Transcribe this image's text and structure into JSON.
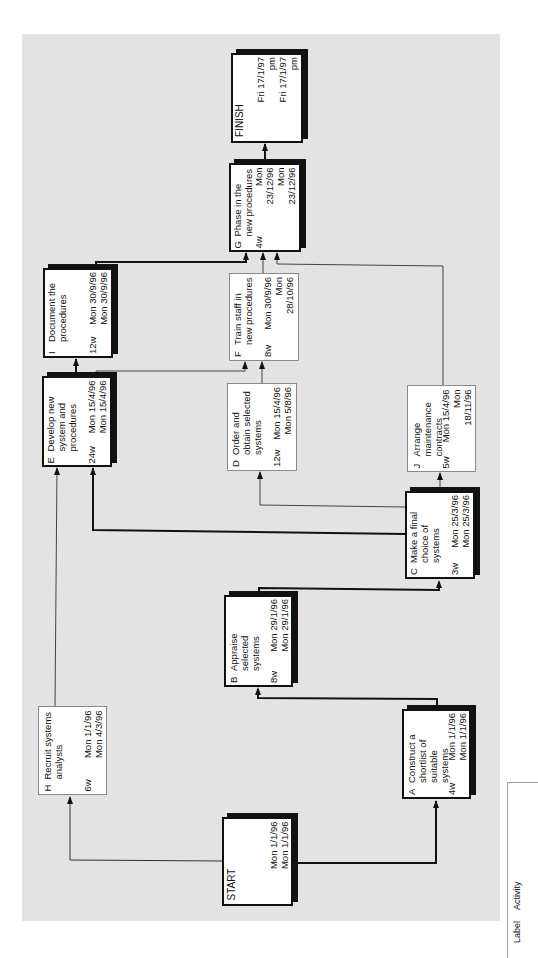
{
  "diagram": {
    "type": "activity-on-node network (rotated 90° counter-clockwise)",
    "start": {
      "title": "START",
      "earliest": "Mon 1/1/96",
      "latest": "Mon 1/1/96"
    },
    "finish": {
      "title": "FINISH",
      "earliest": "Fri 17/1/97 pm",
      "latest": "Fri 17/1/97 pm"
    },
    "activities": {
      "A": {
        "label": "A",
        "desc": "Construct a shortlist of suitable systems",
        "duration": "4w",
        "earliest": "Mon 1/1/96",
        "latest": "Mon 1/1/96",
        "critical": true
      },
      "B": {
        "label": "B",
        "desc": "Appraise selected systems",
        "duration": "8w",
        "earliest": "Mon 29/1/96",
        "latest": "Mon 29/1/96",
        "critical": true
      },
      "C": {
        "label": "C",
        "desc": "Make a final choice of systems",
        "duration": "3w",
        "earliest": "Mon 25/3/96",
        "latest": "Mon 25/3/96",
        "critical": true
      },
      "D": {
        "label": "D",
        "desc": "Order and obtain selected systems",
        "duration": "12w",
        "earliest": "Mon 15/4/96",
        "latest": "Mon 5/8/96",
        "critical": false
      },
      "E": {
        "label": "E",
        "desc": "Develop new system and procedures",
        "duration": "24w",
        "earliest": "Mon 15/4/96",
        "latest": "Mon 15/4/96",
        "critical": true
      },
      "F": {
        "label": "F",
        "desc": "Train staff in new procedures",
        "duration": "8w",
        "earliest": "Mon 30/9/96",
        "latest": "Mon 28/10/96",
        "critical": false
      },
      "G": {
        "label": "G",
        "desc": "Phase in the new procedures",
        "duration": "4w",
        "earliest": "Mon 23/12/96",
        "latest": "Mon 23/12/96",
        "critical": true
      },
      "H": {
        "label": "H",
        "desc": "Recruit systems analysts",
        "duration": "6w",
        "earliest": "Mon 1/1/96",
        "latest": "Mon 4/3/96",
        "critical": false
      },
      "I": {
        "label": "I",
        "desc": "Document the procedures",
        "duration": "12w",
        "earliest": "Mon 30/9/96",
        "latest": "Mon 30/9/96",
        "critical": true
      },
      "J": {
        "label": "J",
        "desc": "Arrange maintenance contracts",
        "duration": "5w",
        "earliest": "Mon 15/4/96",
        "latest": "Mon 18/11/96",
        "critical": false
      }
    },
    "links": [
      {
        "from": "START",
        "to": "H",
        "critical": false
      },
      {
        "from": "START",
        "to": "A",
        "critical": true
      },
      {
        "from": "A",
        "to": "B",
        "critical": true
      },
      {
        "from": "B",
        "to": "C",
        "critical": true
      },
      {
        "from": "C",
        "to": "E",
        "critical": true
      },
      {
        "from": "C",
        "to": "D",
        "critical": false
      },
      {
        "from": "C",
        "to": "J",
        "critical": false
      },
      {
        "from": "H",
        "to": "E",
        "critical": false
      },
      {
        "from": "E",
        "to": "I",
        "critical": true
      },
      {
        "from": "E",
        "to": "F",
        "critical": false
      },
      {
        "from": "D",
        "to": "F",
        "critical": false
      },
      {
        "from": "I",
        "to": "G",
        "critical": true
      },
      {
        "from": "F",
        "to": "G",
        "critical": false
      },
      {
        "from": "J",
        "to": "G",
        "critical": false
      },
      {
        "from": "G",
        "to": "FINISH",
        "critical": true
      }
    ]
  },
  "legend": {
    "label_header": "Label",
    "activity_header": "Activity"
  },
  "colors": {
    "panel": "#e3e3e3",
    "critical": "#111111",
    "normal": "#666666",
    "node_bg": "#ffffff"
  }
}
